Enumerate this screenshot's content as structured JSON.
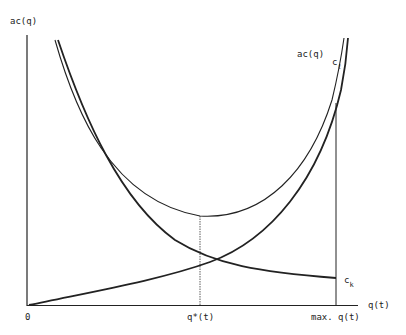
{
  "diagram": {
    "type": "economic cost curves",
    "y_axis_label": "ac(q)",
    "x_axis_label": "q(t)",
    "origin_label": "0",
    "x_ticks": [
      {
        "label": "q*(t)"
      },
      {
        "label": "max. q(t)"
      }
    ],
    "curves": [
      {
        "name": "ac(q)",
        "label": "ac(q)",
        "description": "U-shaped average cost curve with minimum at q*(t)"
      },
      {
        "name": "c_l",
        "label_main": "c",
        "label_sub": "ℓ",
        "description": "increasing cost curve rising steeply near max. q(t)"
      },
      {
        "name": "c_k",
        "label_main": "c",
        "label_sub": "k",
        "description": "decreasing cost curve"
      }
    ],
    "colors": {
      "line": "#222222",
      "background": "#ffffff"
    }
  }
}
